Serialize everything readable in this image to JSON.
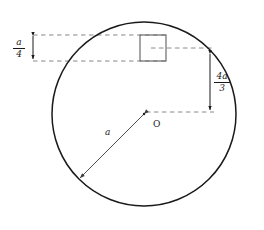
{
  "figure": {
    "background_color": "#ffffff",
    "stroke_color": "#1a1a1a",
    "square_stroke_color": "#6b6b6b",
    "dashed_color": "#8a8a8a",
    "arrow_color": "#4d4d4d"
  },
  "circle": {
    "name": "main-circle",
    "center_x": 144,
    "center_y": 114,
    "radius": 92,
    "center_label": "O"
  },
  "square": {
    "name": "inner-square",
    "x": 140,
    "y": 35,
    "width": 26,
    "height": 26
  },
  "labels": {
    "radius": "a",
    "center": "O"
  },
  "dimensions": [
    {
      "name": "top-offset-dimension",
      "numerator": "a",
      "denominator": "4",
      "value_text": "a/4",
      "orientation": "vertical",
      "x": 33,
      "y_start": 34,
      "y_end": 60
    },
    {
      "name": "vertical-offset-dimension",
      "numerator": "4a",
      "denominator": "3",
      "value_text": "4a/3",
      "orientation": "vertical",
      "x": 210,
      "y_start": 52,
      "y_end": 112
    }
  ],
  "dashed_guides": [
    {
      "name": "guide-square-top",
      "x1": 33,
      "y1": 35,
      "x2": 166,
      "y2": 35
    },
    {
      "name": "guide-square-bottom",
      "x1": 33,
      "y1": 61,
      "x2": 166,
      "y2": 61
    },
    {
      "name": "guide-square-mid",
      "x1": 152,
      "y1": 48,
      "x2": 214,
      "y2": 48
    },
    {
      "name": "guide-center-right",
      "x1": 144,
      "y1": 112,
      "x2": 214,
      "y2": 112
    }
  ],
  "radius_arrow": {
    "name": "radius-arrow",
    "from_x": 144,
    "from_y": 114,
    "to_x": 79,
    "to_y": 179
  }
}
